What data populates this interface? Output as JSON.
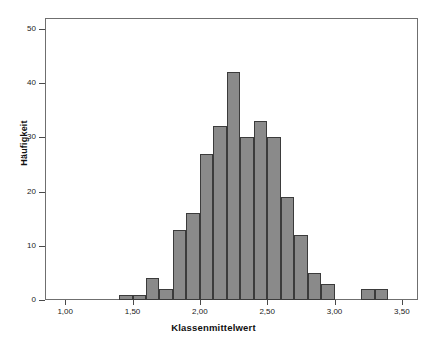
{
  "ghost_title": "",
  "axes": {
    "y": {
      "label": "Häufigkeit",
      "ticks": [
        "0",
        "10",
        "20",
        "30",
        "40",
        "50"
      ],
      "values": [
        0,
        10,
        20,
        30,
        40,
        50
      ],
      "min": 0,
      "max": 52
    },
    "x": {
      "label": "Klassenmittelwert",
      "ticks": [
        "1,00",
        "1,50",
        "2,00",
        "2,50",
        "3,00",
        "3,50"
      ],
      "values": [
        1.0,
        1.5,
        2.0,
        2.5,
        3.0,
        3.5
      ],
      "min": 0.85,
      "max": 3.62
    }
  },
  "style": {
    "bar_fill": "#8a8a8a",
    "bar_border": "#3b3b3b",
    "frame": "#6f6f6f",
    "text": "#1a1a1a",
    "background": "#ffffff"
  },
  "chart_data": {
    "type": "bar",
    "title": "",
    "subtitle": "",
    "xlabel": "Klassenmittelwert",
    "ylabel": "Häufigkeit",
    "xlim": [
      0.85,
      3.62
    ],
    "ylim": [
      0,
      52
    ],
    "grid": false,
    "legend": null,
    "bin_width": 0.1,
    "categories": [
      "1,45",
      "1,55",
      "1,65",
      "1,75",
      "1,85",
      "1,95",
      "2,05",
      "2,15",
      "2,25",
      "2,35",
      "2,45",
      "2,55",
      "2,65",
      "2,75",
      "2,85",
      "2,95",
      "3,25",
      "3,35"
    ],
    "x": [
      1.45,
      1.55,
      1.65,
      1.75,
      1.85,
      1.95,
      2.05,
      2.15,
      2.25,
      2.35,
      2.45,
      2.55,
      2.65,
      2.75,
      2.85,
      2.95,
      3.25,
      3.35
    ],
    "values": [
      1,
      1,
      4,
      2,
      13,
      16,
      27,
      32,
      42,
      30,
      33,
      30,
      19,
      12,
      5,
      3,
      2,
      2
    ]
  }
}
